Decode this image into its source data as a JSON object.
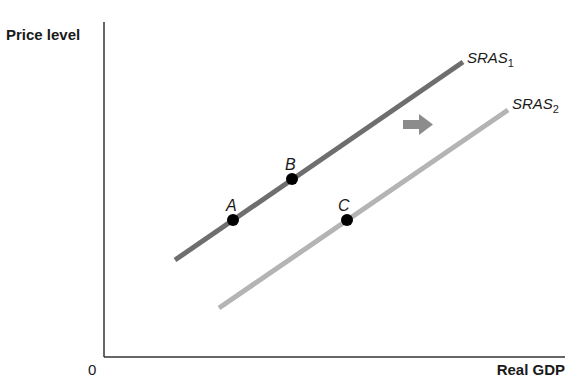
{
  "axes": {
    "y_label": "Price level",
    "x_label": "Real GDP",
    "origin": "0"
  },
  "curves": [
    {
      "name": "SRAS",
      "subscript": "1",
      "color": "#6e6e6e"
    },
    {
      "name": "SRAS",
      "subscript": "2",
      "color": "#b4b4b4"
    }
  ],
  "points": [
    {
      "label": "A",
      "on": "SRAS1"
    },
    {
      "label": "B",
      "on": "SRAS1"
    },
    {
      "label": "C",
      "on": "SRAS2"
    }
  ],
  "shift_arrow": {
    "direction": "right",
    "color": "#8c8c8c"
  }
}
